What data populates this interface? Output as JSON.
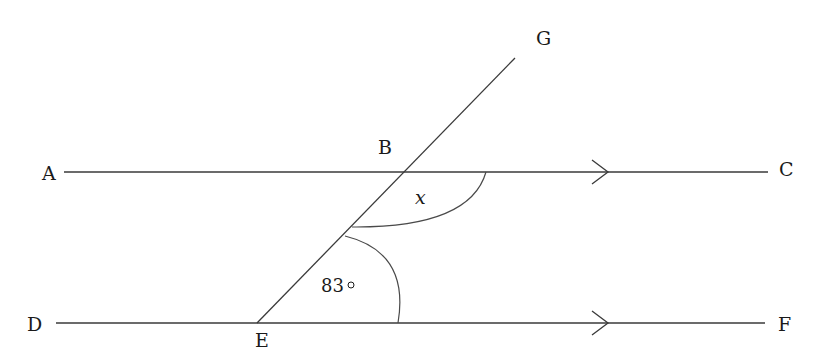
{
  "diagram": {
    "type": "parallel-lines-transversal",
    "points": {
      "A": "A",
      "B": "B",
      "C": "C",
      "D": "D",
      "E": "E",
      "F": "F",
      "G": "G"
    },
    "lines": [
      {
        "name": "AC",
        "from": "A",
        "to": "C",
        "parallel_marker": "arrow"
      },
      {
        "name": "DF",
        "from": "D",
        "to": "F",
        "parallel_marker": "arrow"
      },
      {
        "name": "EG",
        "from": "E",
        "to": "G",
        "type": "transversal"
      }
    ],
    "angles": {
      "unknown": {
        "label": "x",
        "vertex": "B",
        "between": [
          "BE",
          "BC"
        ]
      },
      "given": {
        "label": "83",
        "degree_symbol": "°",
        "vertex": "E",
        "between": [
          "EB",
          "EF"
        ]
      }
    },
    "colors": {
      "line": "#3a3a3a",
      "text": "#1a1a1a",
      "background": "#ffffff"
    }
  }
}
